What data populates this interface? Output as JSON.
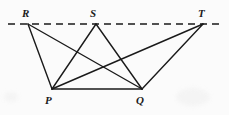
{
  "figure": {
    "background_color": "#fbfbfb",
    "stroke_color": "#1a1a1a",
    "canvas": {
      "width": 229,
      "height": 115
    },
    "baseline": {
      "name": "dashed-reference-line",
      "style": "dashed",
      "y": 24,
      "x_start": 8,
      "x_end": 222,
      "dash_pattern": "7 5"
    },
    "points": [
      {
        "id": "R",
        "label": "R",
        "x": 28,
        "y": 24,
        "label_x": 22,
        "label_y": 8,
        "on_line": true
      },
      {
        "id": "S",
        "label": "S",
        "x": 96,
        "y": 24,
        "label_x": 90,
        "label_y": 8,
        "on_line": true
      },
      {
        "id": "T",
        "label": "T",
        "x": 203,
        "y": 24,
        "label_x": 198,
        "label_y": 8,
        "on_line": true
      },
      {
        "id": "P",
        "label": "P",
        "x": 52,
        "y": 89,
        "label_x": 45,
        "label_y": 95,
        "on_line": false
      },
      {
        "id": "Q",
        "label": "Q",
        "x": 142,
        "y": 89,
        "label_x": 136,
        "label_y": 95,
        "on_line": false
      }
    ],
    "segments": [
      {
        "id": "RP",
        "from": "R",
        "to": "P",
        "style": "solid"
      },
      {
        "id": "RQ",
        "from": "R",
        "to": "Q",
        "style": "solid"
      },
      {
        "id": "SP",
        "from": "S",
        "to": "P",
        "style": "solid"
      },
      {
        "id": "SQ",
        "from": "S",
        "to": "Q",
        "style": "solid"
      },
      {
        "id": "TP",
        "from": "T",
        "to": "P",
        "style": "solid"
      },
      {
        "id": "TQ",
        "from": "T",
        "to": "Q",
        "style": "solid"
      },
      {
        "id": "PQ",
        "from": "P",
        "to": "Q",
        "style": "solid"
      }
    ]
  }
}
